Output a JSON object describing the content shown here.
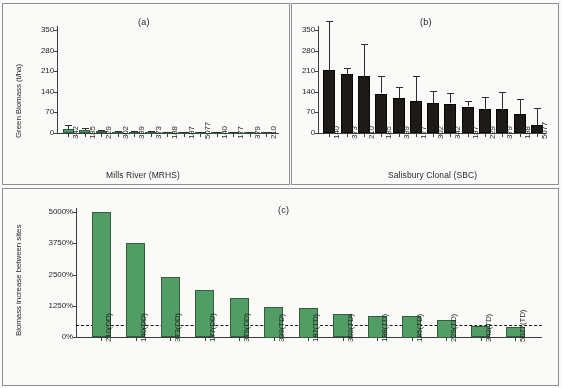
{
  "figure": {
    "panel_a_title": "(a)",
    "panel_b_title": "(b)",
    "panel_c_title": "(c)",
    "green_hex": "#4f9c63",
    "black_hex": "#1a1512"
  },
  "chart_data": [
    {
      "type": "bar",
      "panel": "(a)",
      "title": "(a)",
      "xlabel": "Mills River (MRHS)",
      "ylabel": "Green Biomass (t/ha)",
      "ylim": [
        0,
        350
      ],
      "yticks": [
        0,
        70,
        140,
        210,
        280,
        350
      ],
      "ytick_labels": [
        "0",
        "70",
        "140",
        "210",
        "280",
        "350"
      ],
      "grid": false,
      "legend": "none",
      "categories": [
        "342",
        "185",
        "229",
        "302",
        "339",
        "373",
        "188",
        "187",
        "5077",
        "140",
        "177",
        "379",
        "210"
      ],
      "values": [
        14,
        10,
        7,
        5,
        4.5,
        4,
        3.5,
        3,
        2.5,
        2.5,
        2,
        1.5,
        1
      ],
      "errors": [
        12,
        6,
        3.5,
        2.5,
        2,
        2,
        1.5,
        1.5,
        1,
        1,
        1,
        1,
        0.8
      ]
    },
    {
      "type": "bar",
      "panel": "(b)",
      "title": "(b)",
      "xlabel": "Salisbury Clonal (SBC)",
      "ylabel": "",
      "ylim": [
        0,
        350
      ],
      "yticks": [
        0,
        70,
        140,
        210,
        280,
        350
      ],
      "ytick_labels": [
        "0",
        "70",
        "140",
        "210",
        "280",
        "350"
      ],
      "grid": false,
      "legend": "none",
      "categories": [
        "140",
        "373",
        "210",
        "185",
        "339",
        "177",
        "302",
        "342",
        "187",
        "229",
        "379",
        "188",
        "5077"
      ],
      "values": [
        215,
        200,
        192,
        134,
        119,
        109,
        102,
        100,
        90,
        80,
        80,
        64,
        27
      ],
      "errors": [
        165,
        22,
        110,
        58,
        38,
        85,
        42,
        35,
        18,
        42,
        60,
        52,
        58
      ]
    },
    {
      "type": "bar",
      "panel": "(c)",
      "title": "(c)",
      "xlabel": "",
      "ylabel": "Biomass increase between sites",
      "ylim": [
        0,
        5000
      ],
      "yticks": [
        0,
        1250,
        2500,
        3750,
        5000
      ],
      "ytick_labels": [
        "0%",
        "1250%",
        "2500%",
        "3750%",
        "5000%"
      ],
      "grid": false,
      "legend": "none",
      "reference_line": 500,
      "categories": [
        "210(DD)",
        "140(DD)",
        "373(DD)",
        "177(DD)",
        "379(DD)",
        "339(TD)",
        "187(TD)",
        "302(TD)",
        "188(TD)",
        "185(TD)",
        "229(TD)",
        "342(TD)",
        "5077(TD)"
      ],
      "values": [
        5000,
        3750,
        2400,
        1875,
        1550,
        1220,
        1180,
        920,
        860,
        860,
        700,
        430,
        390
      ]
    }
  ],
  "panel_a": {
    "title": "(a)",
    "ylabel": "Green Biomass (t/ha)",
    "xlabel": "Mills River (MRHS)",
    "yticks": [
      "350",
      "280",
      "210",
      "140",
      "70",
      "0"
    ],
    "xticks": [
      "342",
      "185",
      "229",
      "302",
      "339",
      "373",
      "188",
      "187",
      "5077",
      "140",
      "177",
      "379",
      "210"
    ]
  },
  "panel_b": {
    "title": "(b)",
    "xlabel": "Salisbury Clonal (SBC)",
    "yticks": [
      "350",
      "280",
      "210",
      "140",
      "70",
      "0"
    ],
    "xticks": [
      "140",
      "373",
      "210",
      "185",
      "339",
      "177",
      "302",
      "342",
      "187",
      "229",
      "379",
      "188",
      "5077"
    ]
  },
  "panel_c": {
    "title": "(c)",
    "ylabel": "Biomass increase between sites",
    "yticks": [
      "5000%",
      "3750%",
      "2500%",
      "1250%",
      "0%"
    ],
    "xticks": [
      "210(DD)",
      "140(DD)",
      "373(DD)",
      "177(DD)",
      "379(DD)",
      "339(TD)",
      "187(TD)",
      "302(TD)",
      "188(TD)",
      "185(TD)",
      "229(TD)",
      "342(TD)",
      "5077(TD)"
    ]
  }
}
